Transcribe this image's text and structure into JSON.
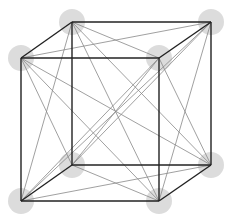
{
  "diagram": {
    "type": "cube-complete-graph",
    "vertex_fill": "#dcdcdc",
    "vertex_radius": 13,
    "edge_color": "#222222",
    "chord_color": "#888888",
    "vertices": [
      {
        "id": "back-top-left",
        "x": 72,
        "y": 22
      },
      {
        "id": "back-top-right",
        "x": 211,
        "y": 22
      },
      {
        "id": "front-top-left",
        "x": 21,
        "y": 58
      },
      {
        "id": "front-top-right",
        "x": 159,
        "y": 58
      },
      {
        "id": "back-bottom-left",
        "x": 72,
        "y": 165
      },
      {
        "id": "back-bottom-right",
        "x": 211,
        "y": 165
      },
      {
        "id": "front-bottom-left",
        "x": 21,
        "y": 201
      },
      {
        "id": "front-bottom-right",
        "x": 159,
        "y": 201
      }
    ],
    "cube_edges": [
      [
        0,
        1
      ],
      [
        2,
        3
      ],
      [
        0,
        2
      ],
      [
        1,
        3
      ],
      [
        4,
        5
      ],
      [
        6,
        7
      ],
      [
        4,
        6
      ],
      [
        5,
        7
      ],
      [
        0,
        4
      ],
      [
        1,
        5
      ],
      [
        2,
        6
      ],
      [
        3,
        7
      ]
    ],
    "chords": [
      [
        0,
        3
      ],
      [
        1,
        2
      ],
      [
        4,
        7
      ],
      [
        5,
        6
      ],
      [
        0,
        6
      ],
      [
        2,
        4
      ],
      [
        1,
        7
      ],
      [
        3,
        5
      ],
      [
        0,
        5
      ],
      [
        1,
        4
      ],
      [
        2,
        7
      ],
      [
        3,
        6
      ],
      [
        0,
        7
      ],
      [
        1,
        6
      ],
      [
        2,
        5
      ],
      [
        3,
        4
      ]
    ]
  }
}
